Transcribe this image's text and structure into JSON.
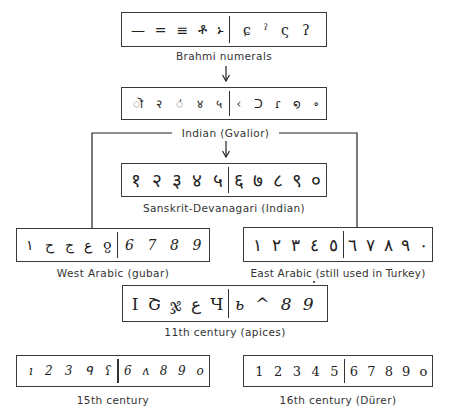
{
  "diagram": {
    "nodes": [
      {
        "id": "brahmi",
        "label": "Brahmi numerals",
        "left_glyphs": [
          "—",
          "=",
          "≡",
          "ቶ",
          "ኑ"
        ],
        "right_glyphs": [
          "ɕ",
          "ˀ",
          "ς",
          "ʔ"
        ]
      },
      {
        "id": "gvalior",
        "label": "Indian (Gvalior)",
        "left_glyphs": [
          "ॊ",
          "२",
          "ऺ",
          "४",
          "५"
        ],
        "right_glyphs": [
          "‹",
          "ᑐ",
          "ɾ",
          "໑",
          "∘"
        ]
      },
      {
        "id": "sanskrit",
        "label": "Sanskrit-Devanagari (Indian)",
        "left_glyphs": [
          "१",
          "२",
          "३",
          "४",
          "५"
        ],
        "right_glyphs": [
          "६",
          "७",
          "८",
          "९",
          "०"
        ]
      },
      {
        "id": "west-arabic",
        "label": "West Arabic (gubar)",
        "left_glyphs": [
          "١",
          "ح",
          "ج",
          "ع",
          "ჹ"
        ],
        "right_glyphs": [
          "6",
          "7",
          "8",
          "9"
        ]
      },
      {
        "id": "east-arabic",
        "label": "East Arabic (still used in Turkey)",
        "left_glyphs": [
          "١",
          "٢",
          "٣",
          "٤",
          "٥"
        ],
        "right_glyphs": [
          "٦",
          "٧",
          "٨",
          "٩",
          "٠"
        ]
      },
      {
        "id": "apices",
        "label": "11th century (apices)",
        "left_glyphs": [
          "I",
          "Շ",
          "ჯ",
          "ع",
          "Ч"
        ],
        "right_glyphs": [
          "ь",
          "^",
          "8",
          "9"
        ]
      },
      {
        "id": "15th-century",
        "label": "15th century",
        "left_glyphs": [
          "ı",
          "2",
          "3",
          "ᑫ",
          "ʕ"
        ],
        "right_glyphs": [
          "6",
          "ʌ",
          "8",
          "9",
          "o"
        ]
      },
      {
        "id": "16th-century",
        "label": "16th century (Dürer)",
        "left_glyphs": [
          "1",
          "2",
          "3",
          "4",
          "5"
        ],
        "right_glyphs": [
          "6",
          "7",
          "8",
          "9",
          "o"
        ]
      }
    ],
    "edges": [
      {
        "from": "brahmi",
        "to": "gvalior"
      },
      {
        "from": "gvalior",
        "to": "sanskrit"
      },
      {
        "from": "gvalior",
        "to": "west-arabic"
      },
      {
        "from": "gvalior",
        "to": "east-arabic"
      }
    ]
  }
}
